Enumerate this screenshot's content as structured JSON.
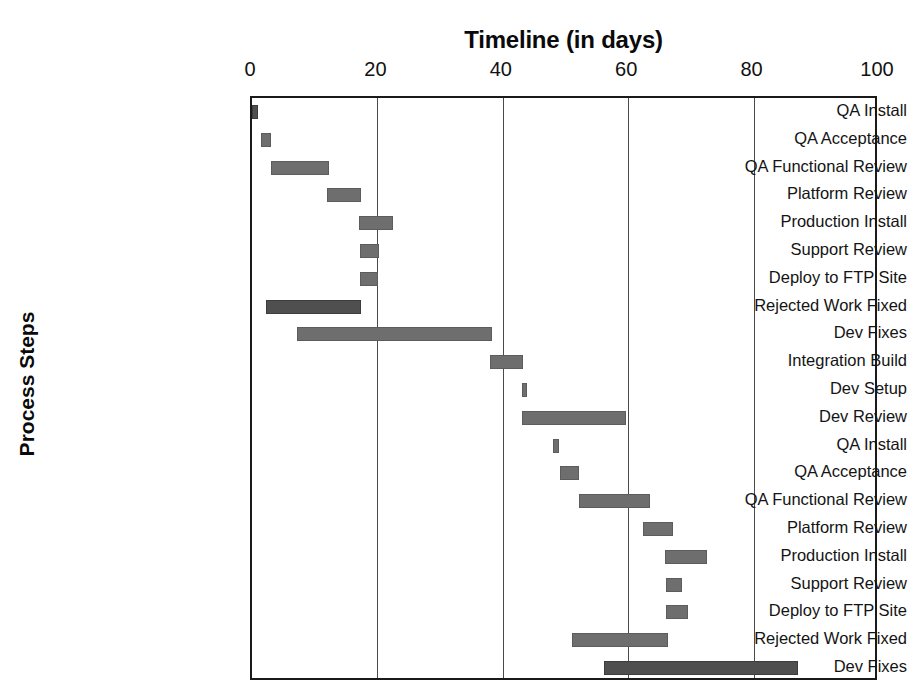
{
  "chart_data": {
    "type": "bar",
    "subtype": "gantt",
    "title": "Timeline (in days)",
    "xlabel": "Timeline (in days)",
    "ylabel": "Process Steps",
    "xlim": [
      0,
      100
    ],
    "xticks": [
      0,
      20,
      40,
      60,
      80,
      100
    ],
    "xticklabels": [
      "0",
      "20",
      "40",
      "60",
      "80",
      "100"
    ],
    "grid": "vertical",
    "legend": "none",
    "bar_color": "#6e6e6e",
    "axis_color": "#1a1a1a",
    "categories": [
      "QA Install",
      "QA Acceptance",
      "QA Functional Review",
      "Platform Review",
      "Production Install",
      "Support Review",
      "Deploy to FTP Site",
      "Rejected Work Fixed",
      "Dev Fixes",
      "Integration Build",
      "Dev Setup",
      "Dev Review",
      "QA Install",
      "QA Acceptance",
      "QA Functional Review",
      "Platform Review",
      "Production Install",
      "Support Review",
      "Deploy to FTP Site",
      "Rejected Work Fixed",
      "Dev Fixes"
    ],
    "tasks": [
      {
        "label": "QA Install",
        "start": 0,
        "end": 1,
        "duration": 1
      },
      {
        "label": "QA Acceptance",
        "start": 1.5,
        "end": 3,
        "duration": 1.5
      },
      {
        "label": "QA Functional Review",
        "start": 3,
        "end": 12.3,
        "duration": 9.3
      },
      {
        "label": "Platform Review",
        "start": 12,
        "end": 17.4,
        "duration": 5.4
      },
      {
        "label": "Production Install",
        "start": 17,
        "end": 22.5,
        "duration": 5.5
      },
      {
        "label": "Support Review",
        "start": 17.2,
        "end": 20.3,
        "duration": 3.1
      },
      {
        "label": "Deploy to FTP Site",
        "start": 17.3,
        "end": 20.1,
        "duration": 2.8
      },
      {
        "label": "Rejected Work Fixed",
        "start": 2.3,
        "end": 17.4,
        "duration": 15.1
      },
      {
        "label": "Dev Fixes",
        "start": 7.1,
        "end": 38.2,
        "duration": 31.1
      },
      {
        "label": "Integration Build",
        "start": 38,
        "end": 43.2,
        "duration": 5.2
      },
      {
        "label": "Dev Setup",
        "start": 43,
        "end": 43.9,
        "duration": 0.9
      },
      {
        "label": "Dev Review",
        "start": 43,
        "end": 59.6,
        "duration": 16.6
      },
      {
        "label": "QA Install",
        "start": 48,
        "end": 48.9,
        "duration": 0.9
      },
      {
        "label": "QA Acceptance",
        "start": 49.2,
        "end": 52.2,
        "duration": 3.0
      },
      {
        "label": "QA Functional Review",
        "start": 52.2,
        "end": 63.4,
        "duration": 11.2
      },
      {
        "label": "Platform Review",
        "start": 62.3,
        "end": 67.1,
        "duration": 4.8
      },
      {
        "label": "Production Install",
        "start": 65.9,
        "end": 72.5,
        "duration": 6.6
      },
      {
        "label": "Support Review",
        "start": 66,
        "end": 68.6,
        "duration": 2.6
      },
      {
        "label": "Deploy to FTP Site",
        "start": 66,
        "end": 69.5,
        "duration": 3.5
      },
      {
        "label": "Rejected Work Fixed",
        "start": 51,
        "end": 66.3,
        "duration": 15.3
      },
      {
        "label": "Dev Fixes",
        "start": 56.1,
        "end": 87.1,
        "duration": 31.0
      }
    ]
  }
}
